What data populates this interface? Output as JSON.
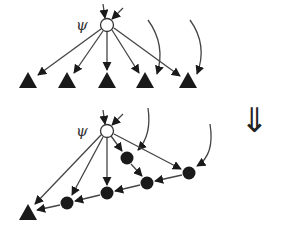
{
  "diagram": {
    "label_psi": "ψ",
    "transform_arrow": "⇓",
    "colors": {
      "edge": "#444444",
      "node": "#1a1a1a",
      "open_node_fill": "#ffffff"
    },
    "top": {
      "psi_node": {
        "x": 107,
        "y": 25
      },
      "leaves": [
        {
          "x": 28,
          "y": 81
        },
        {
          "x": 67,
          "y": 81
        },
        {
          "x": 107,
          "y": 81
        },
        {
          "x": 145,
          "y": 81
        },
        {
          "x": 188,
          "y": 81
        }
      ]
    },
    "bottom": {
      "psi_node": {
        "x": 107,
        "y": 131
      },
      "chain": [
        {
          "x": 127,
          "y": 158
        },
        {
          "x": 147,
          "y": 183
        },
        {
          "x": 189,
          "y": 173
        },
        {
          "x": 107,
          "y": 193
        },
        {
          "x": 67,
          "y": 203
        }
      ],
      "leaf": {
        "x": 28,
        "y": 212
      }
    }
  }
}
